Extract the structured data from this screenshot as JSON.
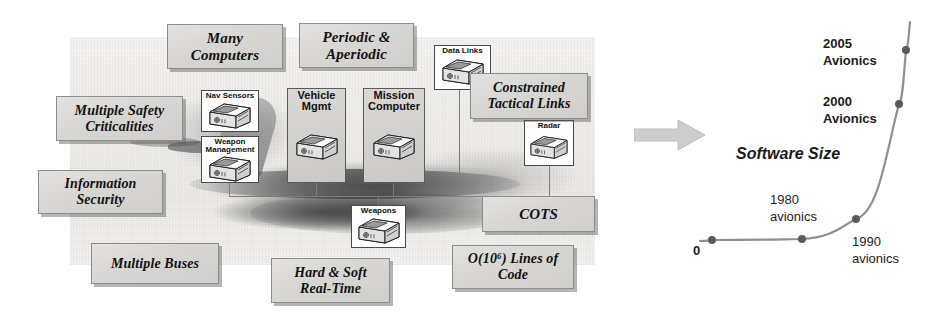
{
  "diagram": {
    "title_hidden": "",
    "background": {
      "name": "military-aircraft-photo"
    },
    "callouts": [
      {
        "id": "many-computers",
        "lines": [
          "Many",
          "Computers"
        ],
        "x": 167,
        "y": 24,
        "w": 116,
        "h": 45,
        "fs": 15
      },
      {
        "id": "periodic-aperiodic",
        "lines": [
          "Periodic &",
          "Aperiodic"
        ],
        "x": 299,
        "y": 23,
        "w": 115,
        "h": 45,
        "fs": 15
      },
      {
        "id": "constrained-links",
        "lines": [
          "Constrained",
          "Tactical Links"
        ],
        "x": 470,
        "y": 73,
        "w": 118,
        "h": 46,
        "fs": 14
      },
      {
        "id": "multiple-safety",
        "lines": [
          "Multiple Safety",
          "Criticalities"
        ],
        "x": 56,
        "y": 96,
        "w": 127,
        "h": 45,
        "fs": 14
      },
      {
        "id": "information-security",
        "lines": [
          "Information",
          "Security"
        ],
        "x": 38,
        "y": 170,
        "w": 125,
        "h": 44,
        "fs": 14
      },
      {
        "id": "cots",
        "lines": [
          "COTS"
        ],
        "x": 482,
        "y": 196,
        "w": 113,
        "h": 36,
        "fs": 15
      },
      {
        "id": "multiple-buses",
        "lines": [
          "Multiple Buses"
        ],
        "x": 91,
        "y": 243,
        "w": 128,
        "h": 41,
        "fs": 14
      },
      {
        "id": "hard-soft-realtime",
        "lines": [
          "Hard & Soft",
          "Real-Time"
        ],
        "x": 271,
        "y": 258,
        "w": 119,
        "h": 45,
        "fs": 14
      },
      {
        "id": "lines-of-code",
        "lines": [
          "O(10⁶) Lines of",
          "Code"
        ],
        "x": 452,
        "y": 245,
        "w": 122,
        "h": 44,
        "fs": 14
      }
    ],
    "components": [
      {
        "id": "nav-sensors",
        "label": "Nav Sensors",
        "x": 201,
        "y": 90,
        "w": 58,
        "h": 42,
        "fs": 8,
        "grey": false
      },
      {
        "id": "weapon-management",
        "label": "Weapon\nManagement",
        "x": 201,
        "y": 136,
        "w": 58,
        "h": 47,
        "fs": 8,
        "grey": false
      },
      {
        "id": "vehicle-mgmt",
        "label": "Vehicle\nMgmt",
        "x": 287,
        "y": 88,
        "w": 59,
        "h": 95,
        "fs": 11,
        "grey": true
      },
      {
        "id": "mission-computer",
        "label": "Mission\nComputer",
        "x": 363,
        "y": 88,
        "w": 62,
        "h": 95,
        "fs": 11,
        "grey": true
      },
      {
        "id": "data-links",
        "label": "Data Links",
        "x": 434,
        "y": 45,
        "w": 57,
        "h": 45,
        "fs": 8,
        "grey": false
      },
      {
        "id": "radar",
        "label": "Radar",
        "x": 524,
        "y": 120,
        "w": 50,
        "h": 46,
        "fs": 8,
        "grey": false
      },
      {
        "id": "weapons",
        "label": "Weapons",
        "x": 351,
        "y": 205,
        "w": 55,
        "h": 43,
        "fs": 8,
        "grey": false
      }
    ],
    "transition_arrow": {
      "name": "transition-arrow",
      "x": 634,
      "y": 118,
      "w": 72,
      "h": 34,
      "color": "#c9c9c9"
    }
  },
  "chart_data": {
    "type": "line",
    "title": "Software Size",
    "xlabel": "",
    "ylabel": "Software Size",
    "origin_label": "0",
    "grid": false,
    "legend": "none",
    "axis_note": "unlabeled exponential growth curve; y = software size, x = time",
    "categories": [
      "0",
      "1980 avionics",
      "1990 avionics",
      "2000 Avionics",
      "2005 Avionics"
    ],
    "points": [
      {
        "label": "0",
        "label_text": "0",
        "x": 0.1,
        "y": 0.06
      },
      {
        "label": "1980 avionics",
        "label_text": "1980\navionics",
        "x": 0.46,
        "y": 0.07
      },
      {
        "label": "1990 avionics",
        "label_text": "1990\navionics",
        "x": 0.68,
        "y": 0.18
      },
      {
        "label": "2000 Avionics",
        "label_text": "2000\nAvionics",
        "x": 0.845,
        "y": 0.62
      },
      {
        "label": "2005 Avionics",
        "label_text": "2005\nAvionics",
        "x": 0.875,
        "y": 0.82
      }
    ],
    "labels": [
      {
        "id": "label-2005",
        "text": "2005\nAvionics",
        "x": 135,
        "y": 21,
        "fs": 13,
        "bold": true
      },
      {
        "id": "label-2000",
        "text": "2000\nAvionics",
        "x": 135,
        "y": 79,
        "fs": 13,
        "bold": true
      },
      {
        "id": "label-title",
        "text": "Software Size",
        "x": 48,
        "y": 129,
        "fs": 16,
        "bold": true
      },
      {
        "id": "label-1980",
        "text": "1980\navionics",
        "x": 82,
        "y": 177,
        "fs": 13,
        "bold": false
      },
      {
        "id": "label-1990",
        "text": "1990\navionics",
        "x": 164,
        "y": 219,
        "fs": 13,
        "bold": false
      },
      {
        "id": "label-zero",
        "text": "0",
        "x": 5,
        "y": 228,
        "fs": 13,
        "bold": true
      }
    ],
    "dots_px": [
      {
        "id": "dot-0",
        "x": 24,
        "y": 226
      },
      {
        "id": "dot-1980",
        "x": 114,
        "y": 225
      },
      {
        "id": "dot-1990",
        "x": 168,
        "y": 205
      },
      {
        "id": "dot-2000",
        "x": 211,
        "y": 90
      },
      {
        "id": "dot-2005",
        "x": 218,
        "y": 36
      }
    ],
    "curve_color": "#8f8f8f",
    "dot_color": "#5a5a5a"
  }
}
